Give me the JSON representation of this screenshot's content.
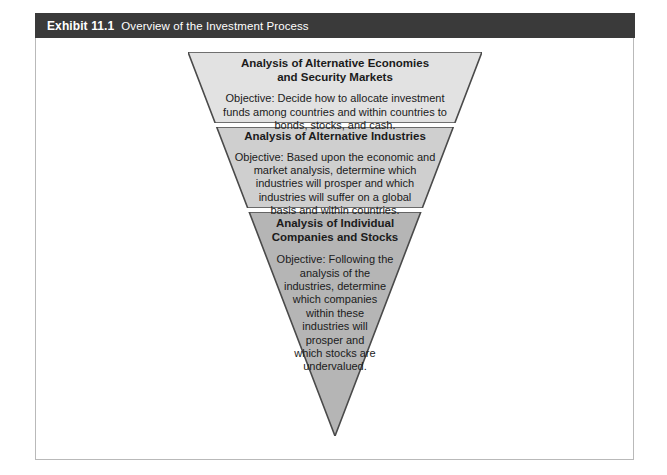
{
  "exhibit": {
    "number": "Exhibit 11.1",
    "title": "Overview of the Investment Process"
  },
  "colors": {
    "header_bar": "#3a3a3a",
    "frame_border": "#b9b9b9",
    "tier1_fill": "#e2e2e2",
    "tier2_fill": "#cfcfcf",
    "tier3_fill": "#b5b5b5",
    "outline": "#4a4a4a",
    "text": "#1b1b1b"
  },
  "funnel": {
    "type": "inverted-triangle-funnel",
    "tiers": [
      {
        "id": "tier-1",
        "title_line1": "Analysis of Alternative Economies",
        "title_line2": "and Security Markets",
        "body_line1": "Objective: Decide how to allocate investment",
        "body_line2": "funds among countries and within countries to",
        "body_line3": "bonds, stocks, and cash."
      },
      {
        "id": "tier-2",
        "title_line1": "Analysis of Alternative Industries",
        "title_line2": "",
        "body_line1": "Objective: Based upon the economic and",
        "body_line2": "market analysis, determine which",
        "body_line3": "industries will prosper and which",
        "body_line4": "industries will suffer on a global",
        "body_line5": "basis and within countries."
      },
      {
        "id": "tier-3",
        "title_line1": "Analysis of Individual",
        "title_line2": "Companies and Stocks",
        "body_line1": "Objective: Following the",
        "body_line2": "analysis of the",
        "body_line3": "industries, determine",
        "body_line4": "which companies",
        "body_line5": "within these",
        "body_line6": "industries will",
        "body_line7": "prosper and",
        "body_line8": "which stocks are",
        "body_line9": "undervalued."
      }
    ]
  }
}
